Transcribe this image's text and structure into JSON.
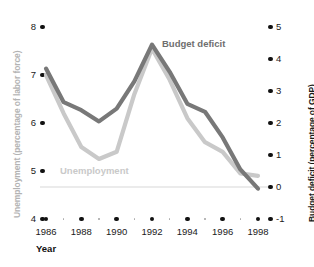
{
  "chart_data": {
    "type": "line",
    "title": "",
    "xlabel": "Year",
    "x": [
      1986,
      1987,
      1988,
      1989,
      1990,
      1991,
      1992,
      1993,
      1994,
      1995,
      1996,
      1997,
      1998
    ],
    "xtick_labels": [
      "1986",
      "1988",
      "1990",
      "1992",
      "1994",
      "1996",
      "1998"
    ],
    "xticks_major": [
      1986,
      1988,
      1990,
      1992,
      1994,
      1996,
      1998
    ],
    "xticks_minor": [
      1987,
      1989,
      1991,
      1993,
      1995,
      1997
    ],
    "xlim": [
      1986,
      1998
    ],
    "grid": false,
    "legend_position": "inline-annotations",
    "axes": [
      {
        "id": "left",
        "label": "Unemployment (percentage of labor force)",
        "ticks": [
          8,
          7,
          6,
          5,
          4
        ],
        "tick_labels": [
          "8",
          "7",
          "6",
          "5",
          "4"
        ],
        "ylim": [
          4,
          8
        ],
        "color": "#b3b3b3"
      },
      {
        "id": "right",
        "label": "Budget deficit (percentage of GDP)",
        "ticks": [
          5,
          4,
          3,
          2,
          1,
          0,
          -1
        ],
        "tick_labels": [
          "5",
          "4",
          "3",
          "2",
          "1",
          "0",
          "-1"
        ],
        "ylim": [
          -1,
          5
        ],
        "color": "#111111"
      }
    ],
    "series": [
      {
        "name": "Budget deficit",
        "axis": "right",
        "color": "#787878",
        "label_text": "Budget deficit",
        "values": [
          3.7,
          2.65,
          2.4,
          2.05,
          2.45,
          3.3,
          4.45,
          3.6,
          2.6,
          2.35,
          1.55,
          0.55,
          -0.05
        ]
      },
      {
        "name": "Unemployment",
        "axis": "left",
        "color": "#c9c9c9",
        "label_text": "Unemployment",
        "values": [
          7.0,
          6.2,
          5.5,
          5.25,
          5.4,
          6.6,
          7.55,
          6.9,
          6.1,
          5.6,
          5.4,
          4.95,
          4.9
        ]
      }
    ],
    "zero_reference_line": {
      "axis": "right",
      "value": 0,
      "color": "#d8d8d8"
    }
  }
}
